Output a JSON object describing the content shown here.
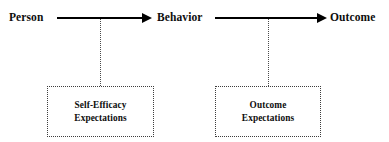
{
  "diagram": {
    "background_color": "#ffffff",
    "line_color": "#000000",
    "text_color": "#0d0d0d",
    "dotted_color": "#3d3d3d",
    "nodes": [
      {
        "id": "person",
        "label": "Person"
      },
      {
        "id": "behavior",
        "label": "Behavior"
      },
      {
        "id": "outcome",
        "label": "Outcome"
      }
    ],
    "arrows": [
      {
        "id": "person-to-behavior",
        "from": "Person",
        "to": "Behavior",
        "style": "solid-filled-head"
      },
      {
        "id": "behavior-to-outcome",
        "from": "Behavior",
        "to": "Outcome",
        "style": "solid-filled-head"
      }
    ],
    "boxes": [
      {
        "id": "self-efficacy-expectations",
        "line1": "Self-Efficacy",
        "line2": "Expectations",
        "border_style": "dotted",
        "attaches_to": "person-to-behavior"
      },
      {
        "id": "outcome-expectations",
        "line1": "Outcome",
        "line2": "Expectations",
        "border_style": "dotted",
        "attaches_to": "behavior-to-outcome"
      }
    ],
    "connectors": [
      {
        "id": "connector-self-efficacy",
        "style": "dotted",
        "from": "person-to-behavior",
        "to": "self-efficacy-expectations"
      },
      {
        "id": "connector-outcome-exp",
        "style": "dotted",
        "from": "behavior-to-outcome",
        "to": "outcome-expectations"
      }
    ]
  }
}
